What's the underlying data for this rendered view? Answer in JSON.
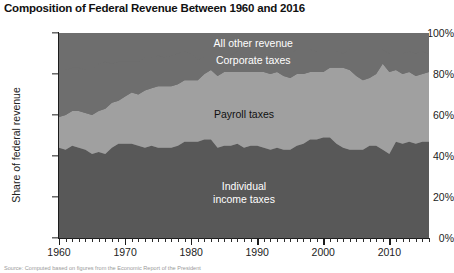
{
  "chart_data": {
    "type": "area",
    "title": "Composition of Federal Revenue Between 1960 and 2016",
    "xlabel": "",
    "ylabel": "Share of federal revenue",
    "stacked": true,
    "normalized_percent": true,
    "xlim": [
      1960,
      2016
    ],
    "ylim": [
      0,
      100
    ],
    "grid": false,
    "legend_position": "inline-annotations",
    "ytick_labels": [
      "0%",
      "20%",
      "40%",
      "60%",
      "80%",
      "100%"
    ],
    "ytick_values": [
      0,
      20,
      40,
      60,
      80,
      100
    ],
    "xtick_labels": [
      "1960",
      "1970",
      "1980",
      "1990",
      "2000",
      "2010"
    ],
    "xtick_values": [
      1960,
      1970,
      1980,
      1990,
      2000,
      2010
    ],
    "xtick_minor_step": 1,
    "x": [
      1960,
      1961,
      1962,
      1963,
      1964,
      1965,
      1966,
      1967,
      1968,
      1969,
      1970,
      1971,
      1972,
      1973,
      1974,
      1975,
      1976,
      1977,
      1978,
      1979,
      1980,
      1981,
      1982,
      1983,
      1984,
      1985,
      1986,
      1987,
      1988,
      1989,
      1990,
      1991,
      1992,
      1993,
      1994,
      1995,
      1996,
      1997,
      1998,
      1999,
      2000,
      2001,
      2002,
      2003,
      2004,
      2005,
      2006,
      2007,
      2008,
      2009,
      2010,
      2011,
      2012,
      2013,
      2014,
      2015,
      2016
    ],
    "series": [
      {
        "name": "Individual income taxes",
        "color": "#585858",
        "label_lines": [
          "Individual",
          "income taxes"
        ],
        "values": [
          44,
          43,
          45,
          44,
          43,
          41,
          42,
          41,
          44,
          46,
          46,
          46,
          45,
          44,
          45,
          44,
          44,
          44,
          45,
          47,
          47,
          47,
          48,
          48,
          44,
          45,
          45,
          46,
          44,
          45,
          45,
          44,
          43,
          44,
          43,
          43,
          45,
          46,
          48,
          48,
          49,
          49,
          46,
          44,
          43,
          43,
          43,
          45,
          45,
          43,
          41,
          47,
          46,
          47,
          46,
          47,
          47
        ]
      },
      {
        "name": "Payroll taxes",
        "color": "#a0a0a0",
        "label_lines": [
          "Payroll taxes"
        ],
        "values": [
          15,
          17,
          17,
          18,
          18,
          19,
          20,
          22,
          22,
          21,
          23,
          25,
          25,
          28,
          28,
          30,
          30,
          30,
          30,
          30,
          30,
          30,
          32,
          34,
          35,
          36,
          36,
          35,
          37,
          36,
          36,
          37,
          37,
          37,
          36,
          35,
          35,
          34,
          33,
          33,
          32,
          34,
          37,
          39,
          39,
          36,
          34,
          33,
          35,
          42,
          40,
          35,
          34,
          34,
          33,
          33,
          34
        ]
      },
      {
        "name": "Corporate taxes",
        "color": "#6e6e6e",
        "label_lines": [
          "Corporate taxes"
        ],
        "values": [
          23,
          22,
          21,
          21,
          21,
          22,
          23,
          23,
          19,
          19,
          17,
          15,
          16,
          16,
          15,
          15,
          14,
          15,
          15,
          14,
          13,
          10,
          8,
          6,
          9,
          8,
          8,
          10,
          10,
          10,
          9,
          9,
          9,
          10,
          11,
          12,
          12,
          12,
          11,
          10,
          10,
          8,
          8,
          7,
          10,
          13,
          15,
          14,
          12,
          7,
          9,
          8,
          10,
          10,
          11,
          11,
          9
        ]
      },
      {
        "name": "All other revenue",
        "color": "#6e6e6e",
        "label_lines": [
          "All other revenue"
        ],
        "values": [
          18,
          18,
          17,
          17,
          18,
          18,
          15,
          14,
          15,
          14,
          14,
          14,
          14,
          12,
          12,
          11,
          12,
          11,
          10,
          9,
          10,
          13,
          12,
          12,
          12,
          11,
          11,
          9,
          9,
          9,
          10,
          10,
          11,
          9,
          10,
          10,
          8,
          8,
          8,
          9,
          9,
          9,
          9,
          10,
          8,
          8,
          8,
          8,
          8,
          8,
          10,
          10,
          10,
          9,
          10,
          9,
          10
        ]
      }
    ]
  },
  "source": {
    "text": "Source: Computed based on figures from the Economic Report of the President"
  }
}
